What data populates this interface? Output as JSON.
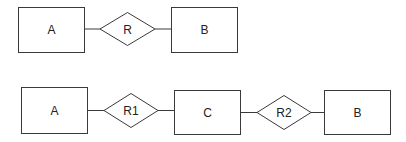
{
  "diagram": {
    "type": "entity-relationship",
    "colors": {
      "stroke": "#3a3a3a",
      "text": "#222222",
      "background": "#ffffff"
    },
    "rows": [
      {
        "name": "binary-relationship",
        "nodes": [
          {
            "id": "A",
            "shape": "rectangle",
            "label": "A"
          },
          {
            "id": "R",
            "shape": "diamond",
            "label": "R"
          },
          {
            "id": "B",
            "shape": "rectangle",
            "label": "B"
          }
        ],
        "edges": [
          [
            "A",
            "R"
          ],
          [
            "R",
            "B"
          ]
        ]
      },
      {
        "name": "decomposed-relationship",
        "nodes": [
          {
            "id": "A",
            "shape": "rectangle",
            "label": "A"
          },
          {
            "id": "R1",
            "shape": "diamond",
            "label": "R1"
          },
          {
            "id": "C",
            "shape": "rectangle",
            "label": "C"
          },
          {
            "id": "R2",
            "shape": "diamond",
            "label": "R2"
          },
          {
            "id": "B",
            "shape": "rectangle",
            "label": "B"
          }
        ],
        "edges": [
          [
            "A",
            "R1"
          ],
          [
            "R1",
            "C"
          ],
          [
            "C",
            "R2"
          ],
          [
            "R2",
            "B"
          ]
        ]
      }
    ]
  }
}
